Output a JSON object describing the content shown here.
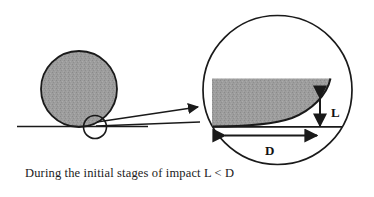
{
  "figure": {
    "caption": "During the initial stages of impact L < D",
    "palette": {
      "ink": "#1a1a1a",
      "shading": "#9a9a9a",
      "background": "#ffffff"
    },
    "left_view": {
      "name": "impacting ball resting on surface",
      "ball_label": "",
      "ground_label": "",
      "callout_label": ""
    },
    "magnified_view": {
      "name": "magnified contact region",
      "dimensions": [
        {
          "symbol": "L",
          "meaning": "penetration depth",
          "orientation": "vertical"
        },
        {
          "symbol": "D",
          "meaning": "contact diameter",
          "orientation": "horizontal"
        }
      ]
    },
    "relation": "L < D"
  }
}
